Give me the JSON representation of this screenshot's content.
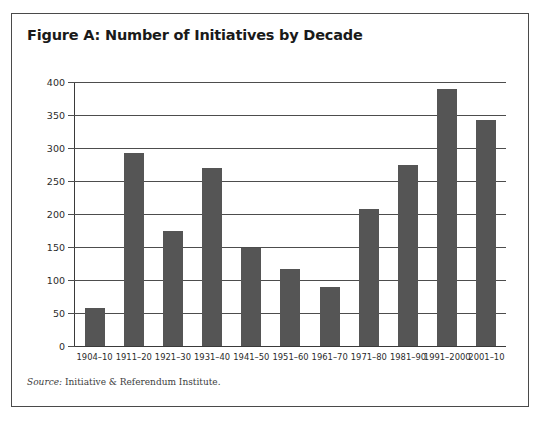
{
  "figure": {
    "title": "Figure A: Number of Initiatives by Decade",
    "source_label": "Source:",
    "source_text": "Initiative & Referendum Institute.",
    "bar_color": "#555555",
    "axis_color": "#4d4d4d",
    "border_color": "#4a4a4a",
    "background": "#ffffff"
  },
  "chart_data": {
    "type": "bar",
    "title": "Figure A: Number of Initiatives by Decade",
    "xlabel": "",
    "ylabel": "",
    "categories": [
      "1904–10",
      "1911–20",
      "1921–30",
      "1931–40",
      "1941–50",
      "1951–60",
      "1961–70",
      "1971–80",
      "1981–90",
      "1991–2000",
      "2001–10"
    ],
    "values": [
      58,
      293,
      175,
      269,
      148,
      117,
      89,
      208,
      275,
      389,
      343
    ],
    "ylim": [
      0,
      400
    ],
    "ytick_values": [
      0,
      50,
      100,
      150,
      200,
      250,
      300,
      350,
      400
    ],
    "ytick_labels": [
      "0",
      "50",
      "100",
      "150",
      "200",
      "250",
      "300",
      "350",
      "400"
    ],
    "grid": true,
    "grid_axis": "y",
    "legend": null,
    "legend_position": "none",
    "series": [
      {
        "name": "Number of Initiatives",
        "values": [
          58,
          293,
          175,
          269,
          148,
          117,
          89,
          208,
          275,
          389,
          343
        ]
      }
    ]
  }
}
